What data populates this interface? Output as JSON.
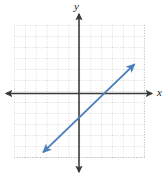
{
  "figure": {
    "kind": "coordinate-plane-line-graph",
    "width": 167,
    "height": 181,
    "background_color": "#ffffff"
  },
  "axes": {
    "x_label": "x",
    "y_label": "y",
    "axis_color": "#3b3b3b",
    "origin_px": {
      "x": 79,
      "y": 93.5
    },
    "cell_size_px": 10.9,
    "x_range": [
      -6,
      6
    ],
    "y_range": [
      -6,
      6
    ],
    "grid": {
      "visible": true,
      "style": "dotted",
      "color": "#b9b9bd",
      "left_px": 14,
      "right_px": 144,
      "top_px": 25,
      "bottom_px": 157,
      "columns": 12,
      "rows": 12
    },
    "x_axis_arrows": [
      "left",
      "right"
    ],
    "y_axis_arrows": [
      "up",
      "down"
    ]
  },
  "chart_data": {
    "type": "line",
    "title": "",
    "xlabel": "x",
    "ylabel": "y",
    "xlim": [
      -6,
      6
    ],
    "ylim": [
      -6,
      6
    ],
    "grid": true,
    "legend": null,
    "series": [
      {
        "name": "line",
        "color": "#4a7fbd",
        "arrows": "both",
        "slope": 1,
        "intercept": -2,
        "endpoints": [
          {
            "x": -3.3,
            "y": -5.4
          },
          {
            "x": 5.1,
            "y": 2.7
          }
        ],
        "points": [
          {
            "x": -3.3,
            "y": -5.4
          },
          {
            "x": 0,
            "y": -2
          },
          {
            "x": 2,
            "y": 0
          },
          {
            "x": 5.1,
            "y": 2.7
          }
        ]
      }
    ]
  }
}
